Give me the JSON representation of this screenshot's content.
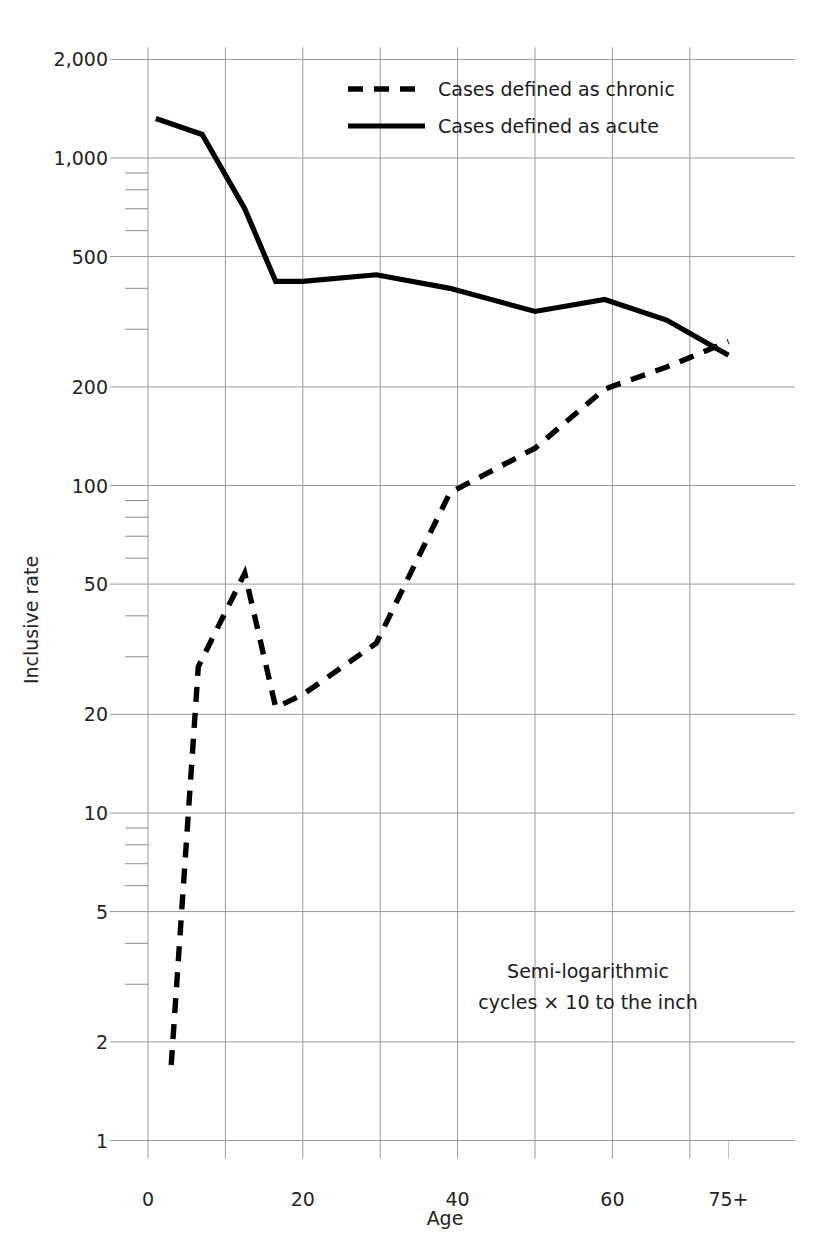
{
  "chart_data": {
    "type": "line",
    "title": "",
    "xlabel": "Age",
    "ylabel": "Inclusive rate",
    "yscale": "log",
    "ylim": [
      1,
      2000
    ],
    "xlim": [
      -2,
      78
    ],
    "grid": true,
    "legend_position": "top-center",
    "annotation_line1": "Semi-logarithmic",
    "annotation_line2": "cycles × 10 to the inch",
    "x_tick_labels": [
      "0",
      "20",
      "40",
      "60",
      "75+"
    ],
    "x_tick_values": [
      0,
      20,
      40,
      60,
      75
    ],
    "x_gridline_values": [
      0,
      10,
      20,
      30,
      40,
      50,
      60,
      70
    ],
    "y_tick_labels": [
      "2,000",
      "1,000",
      "500",
      "200",
      "100",
      "50",
      "20",
      "10",
      "5",
      "2",
      "1"
    ],
    "y_tick_values": [
      2000,
      1000,
      500,
      200,
      100,
      50,
      20,
      10,
      5,
      2,
      1
    ],
    "series": [
      {
        "name": "Cases defined as chronic",
        "style": "dashed",
        "color": "#000000",
        "x": [
          3,
          6.5,
          8,
          12.5,
          16.5,
          20,
          29.5,
          39,
          50,
          59,
          67,
          75
        ],
        "values": [
          1.7,
          28,
          33,
          54,
          21,
          23,
          33,
          95,
          130,
          197,
          230,
          275
        ]
      },
      {
        "name": "Cases defined as acute",
        "style": "solid",
        "color": "#000000",
        "x": [
          1,
          7,
          12.5,
          16.5,
          20,
          29.5,
          39,
          50,
          59,
          67,
          75
        ],
        "values": [
          1320,
          1180,
          700,
          420,
          420,
          440,
          400,
          340,
          370,
          320,
          250
        ]
      }
    ]
  },
  "legend": {
    "items": [
      {
        "label": "Cases defined as chronic",
        "style": "dashed"
      },
      {
        "label": "Cases defined as acute",
        "style": "solid"
      }
    ]
  }
}
